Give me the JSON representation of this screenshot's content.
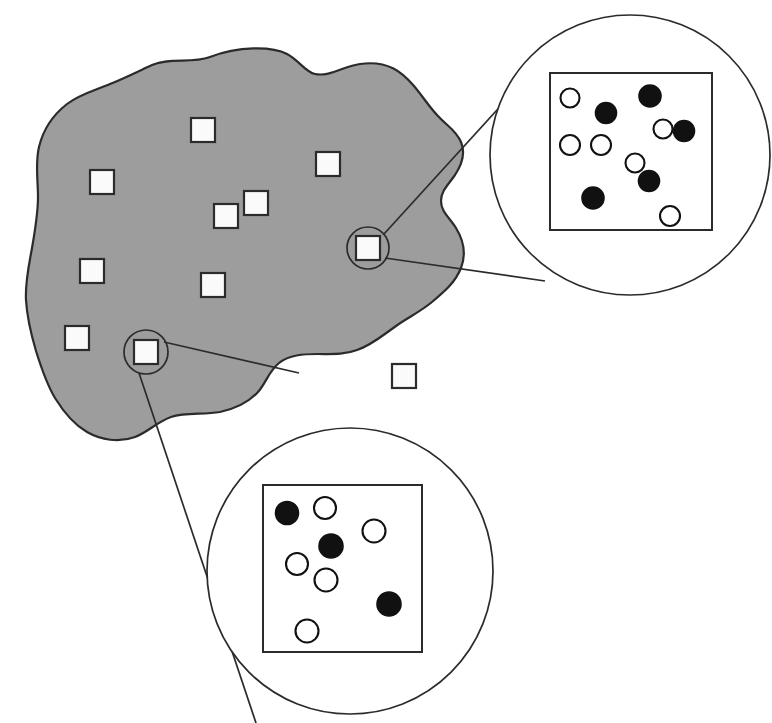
{
  "figure": {
    "background_color": "#ffffff",
    "region_fill_color": "#9d9d9d",
    "region_stroke_color": "#2b2b2b",
    "plot_fill_color": "#fafafa",
    "dot_filled_color": "#111111",
    "dot_open_color": "#ffffff",
    "canvas": {
      "width": 772,
      "height": 723
    }
  },
  "region": {
    "name": "study-area",
    "outline_path": "M 210 57 C 238 46 272 46 287 54 C 300 61 305 72 315 74 C 330 77 344 66 360 64 C 388 60 402 72 414 86 C 424 98 430 108 438 116 C 447 126 456 130 461 142 C 466 154 461 166 455 175 C 448 185 441 191 441 201 C 441 212 450 218 456 228 C 464 241 466 255 461 268 C 455 283 444 292 432 302 C 420 312 407 318 396 326 C 383 335 372 345 357 350 C 344 355 331 354 318 354 C 303 354 289 355 279 363 C 269 371 266 383 258 392 C 248 403 234 409 220 412 C 203 415 186 412 171 417 C 157 422 148 432 135 437 C 119 443 101 440 87 432 C 73 424 63 411 55 398 C 46 383 41 367 36 351 C 31 334 27 317 26 300 C 25 282 29 265 32 248 C 35 231 38 214 38 197 C 38 180 35 163 39 147 C 43 130 53 115 67 104 C 80 94 96 90 110 84 C 125 78 139 71 152 65 C 170 57 191 64 210 57 Z"
  },
  "plots": [
    {
      "name": "plot-1",
      "x": 191,
      "y": 118,
      "size": 24,
      "circled": false
    },
    {
      "name": "plot-2",
      "x": 90,
      "y": 170,
      "size": 24,
      "circled": false
    },
    {
      "name": "plot-3",
      "x": 316,
      "y": 152,
      "size": 24,
      "circled": false
    },
    {
      "name": "plot-4",
      "x": 244,
      "y": 191,
      "size": 24,
      "circled": false
    },
    {
      "name": "plot-5",
      "x": 214,
      "y": 204,
      "size": 24,
      "circled": false
    },
    {
      "name": "plot-6",
      "x": 80,
      "y": 259,
      "size": 24,
      "circled": false
    },
    {
      "name": "plot-7",
      "x": 201,
      "y": 273,
      "size": 24,
      "circled": false
    },
    {
      "name": "plot-8",
      "x": 65,
      "y": 326,
      "size": 24,
      "circled": false
    },
    {
      "name": "plot-9",
      "x": 392,
      "y": 364,
      "size": 24,
      "circled": false
    },
    {
      "name": "plot-10-circled-upper",
      "x": 356,
      "y": 236,
      "size": 24,
      "circled": true,
      "circle_cx": 368,
      "circle_cy": 248,
      "circle_r": 21
    },
    {
      "name": "plot-11-circled-lower",
      "x": 134,
      "y": 340,
      "size": 24,
      "circled": true,
      "circle_cx": 146,
      "circle_cy": 352,
      "circle_r": 22
    }
  ],
  "callouts": [
    {
      "name": "callout-upper-right",
      "source_plot": "plot-10-circled-upper",
      "leader_lines": [
        {
          "x1": 384,
          "y1": 234,
          "x2": 537,
          "y2": 66
        },
        {
          "x1": 385,
          "y1": 258,
          "x2": 545,
          "y2": 281
        }
      ],
      "magnifier": {
        "cx": 630,
        "cy": 155,
        "r": 140
      },
      "inset": {
        "name": "inset-frame-upper",
        "x": 550,
        "y": 73,
        "width": 162,
        "height": 157,
        "dots": [
          {
            "id": "u1",
            "cx": 570,
            "cy": 98,
            "r": 9.5,
            "type": "open"
          },
          {
            "id": "u2",
            "cx": 606,
            "cy": 113,
            "r": 10.5,
            "type": "filled"
          },
          {
            "id": "u3",
            "cx": 650,
            "cy": 96,
            "r": 11,
            "type": "filled"
          },
          {
            "id": "u4",
            "cx": 663,
            "cy": 129,
            "r": 9.5,
            "type": "open"
          },
          {
            "id": "u5",
            "cx": 684,
            "cy": 131,
            "r": 10.5,
            "type": "filled"
          },
          {
            "id": "u6",
            "cx": 570,
            "cy": 145,
            "r": 10,
            "type": "open"
          },
          {
            "id": "u7",
            "cx": 601,
            "cy": 145,
            "r": 10,
            "type": "open"
          },
          {
            "id": "u8",
            "cx": 635,
            "cy": 163,
            "r": 9.5,
            "type": "open"
          },
          {
            "id": "u9",
            "cx": 649,
            "cy": 181,
            "r": 10.5,
            "type": "filled"
          },
          {
            "id": "u10",
            "cx": 593,
            "cy": 198,
            "r": 11,
            "type": "filled"
          },
          {
            "id": "u11",
            "cx": 670,
            "cy": 216,
            "r": 10,
            "type": "open"
          }
        ],
        "counts": {
          "filled": 5,
          "open": 6,
          "total": 11
        }
      }
    },
    {
      "name": "callout-lower-left",
      "source_plot": "plot-11-circled-lower",
      "leader_lines": [
        {
          "x1": 164,
          "y1": 342,
          "x2": 299,
          "y2": 373
        },
        {
          "x1": 139,
          "y1": 373,
          "x2": 256,
          "y2": 723
        }
      ],
      "magnifier": {
        "cx": 350,
        "cy": 571,
        "r": 143
      },
      "inset": {
        "name": "inset-frame-lower",
        "x": 263,
        "y": 485,
        "width": 159,
        "height": 167,
        "dots": [
          {
            "id": "l1",
            "cx": 287,
            "cy": 513,
            "r": 11.5,
            "type": "filled"
          },
          {
            "id": "l2",
            "cx": 325,
            "cy": 508,
            "r": 11,
            "type": "open"
          },
          {
            "id": "l3",
            "cx": 374,
            "cy": 531,
            "r": 11.5,
            "type": "open"
          },
          {
            "id": "l4",
            "cx": 331,
            "cy": 546,
            "r": 12,
            "type": "filled"
          },
          {
            "id": "l5",
            "cx": 297,
            "cy": 564,
            "r": 11,
            "type": "open"
          },
          {
            "id": "l6",
            "cx": 326,
            "cy": 580,
            "r": 11.5,
            "type": "open"
          },
          {
            "id": "l7",
            "cx": 389,
            "cy": 604,
            "r": 12,
            "type": "filled"
          },
          {
            "id": "l8",
            "cx": 307,
            "cy": 631,
            "r": 11.5,
            "type": "open"
          }
        ],
        "counts": {
          "filled": 3,
          "open": 5,
          "total": 8
        }
      }
    }
  ]
}
